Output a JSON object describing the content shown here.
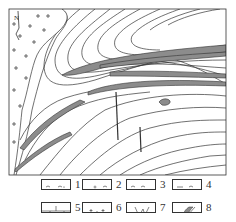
{
  "figure": {
    "type": "geological-map",
    "north_arrow": "N",
    "colors": {
      "line": "#333333",
      "ore_body": "#8c8c8c",
      "background": "#ffffff"
    }
  },
  "legend": {
    "items": [
      {
        "num": "1",
        "pattern": "wavy-dotted"
      },
      {
        "num": "2",
        "pattern": "wavy-circles"
      },
      {
        "num": "3",
        "pattern": "wavy"
      },
      {
        "num": "4",
        "pattern": "wavy-dashed"
      },
      {
        "num": "5",
        "pattern": "brick"
      },
      {
        "num": "6",
        "pattern": "crosses"
      },
      {
        "num": "7",
        "pattern": "vein"
      },
      {
        "num": "8",
        "pattern": "ore-body"
      }
    ]
  }
}
